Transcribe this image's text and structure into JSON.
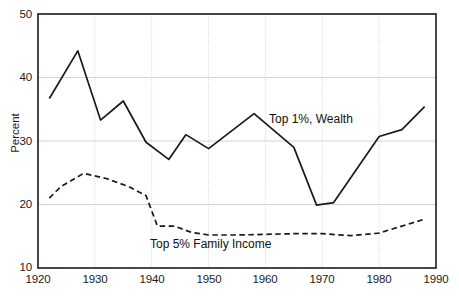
{
  "chart_data": {
    "type": "line",
    "title": "",
    "subtitle": "",
    "xlabel": "",
    "ylabel": "Percent",
    "xlim": [
      1920,
      1990
    ],
    "ylim": [
      10,
      50
    ],
    "xticks": [
      1920,
      1930,
      1940,
      1950,
      1960,
      1970,
      1980,
      1990
    ],
    "yticks": [
      10,
      20,
      30,
      40,
      50
    ],
    "xtick_labels": [
      "1920",
      "1930",
      "1940",
      "1950",
      "1960",
      "1970",
      "1980",
      "1990"
    ],
    "ytick_labels": [
      "10",
      "20",
      "30",
      "40",
      "50"
    ],
    "grid": true,
    "grid_color": "#c8c8c8",
    "legend_position": "inline-annotations",
    "background": "#ffffff",
    "axis_color": "#1a1a1a",
    "series": [
      {
        "name": "Top 1%, Wealth",
        "style": "solid",
        "color": "#1a1a1a",
        "annotation": "Top 1%, Wealth",
        "x": [
          1922,
          1927,
          1931,
          1935,
          1939,
          1943,
          1946,
          1950,
          1958,
          1965,
          1969,
          1972,
          1980,
          1984,
          1988
        ],
        "values": [
          36.7,
          44.2,
          33.3,
          36.3,
          29.8,
          27.1,
          31.0,
          28.8,
          34.3,
          29.0,
          19.9,
          20.3,
          30.7,
          31.8,
          35.4
        ]
      },
      {
        "name": "Top 5% Family Income",
        "style": "dashed",
        "color": "#1a1a1a",
        "annotation": "Top 5% Family Income",
        "x": [
          1922,
          1924,
          1928,
          1932,
          1936,
          1939,
          1941,
          1944,
          1947,
          1950,
          1955,
          1960,
          1965,
          1970,
          1975,
          1980,
          1984,
          1988
        ],
        "values": [
          21.0,
          22.8,
          24.9,
          24.1,
          22.8,
          21.4,
          16.6,
          16.6,
          15.6,
          15.2,
          15.2,
          15.3,
          15.4,
          15.4,
          15.1,
          15.5,
          16.6,
          17.7
        ]
      }
    ]
  }
}
